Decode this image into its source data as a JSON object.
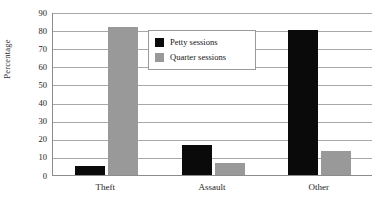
{
  "chart_data": {
    "type": "bar",
    "title": "",
    "subtitle": "",
    "xlabel": "",
    "ylabel": "Percentage",
    "categories": [
      "Theft",
      "Assault",
      "Other"
    ],
    "series": [
      {
        "name": "Petty sessions",
        "color": "#0a0a0a",
        "values": [
          5,
          16.5,
          80
        ]
      },
      {
        "name": "Quarter sessions",
        "color": "#999999",
        "values": [
          82,
          6.5,
          13
        ]
      }
    ],
    "ylim": [
      0,
      90
    ],
    "yticks": [
      0,
      10,
      20,
      30,
      40,
      50,
      60,
      70,
      80,
      90
    ],
    "ytick_labels": [
      "0",
      "10",
      "20",
      "30",
      "40",
      "50",
      "60",
      "70",
      "80",
      "90"
    ],
    "grid": true,
    "grid_axis": "y",
    "legend_position": "upper-center",
    "annotations": []
  },
  "legend": {
    "items": [
      {
        "label": "Petty sessions",
        "color": "#0a0a0a"
      },
      {
        "label": "Quarter sessions",
        "color": "#999999"
      }
    ]
  },
  "axes": {
    "y_title": "Percentage"
  },
  "colors": {
    "petty": "#0a0a0a",
    "quarter": "#999999",
    "gridline": "#a8a8a8",
    "axis": "#8c8c8c",
    "background": "#ffffff",
    "text": "#1c1c1c"
  }
}
